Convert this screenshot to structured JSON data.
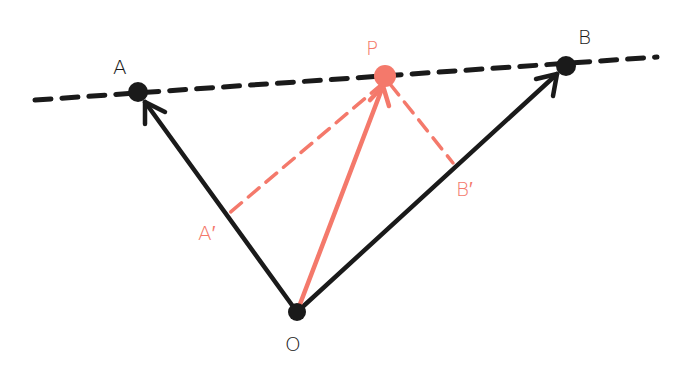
{
  "colors": {
    "black": "#1a1a1a",
    "salmon": "#f4796b",
    "background": "#ffffff"
  },
  "diagram": {
    "type": "vector-projection",
    "points": {
      "O": {
        "label": "O",
        "x": 297,
        "y": 312
      },
      "A": {
        "label": "A",
        "x": 138,
        "y": 92
      },
      "B": {
        "label": "B",
        "x": 566,
        "y": 66
      },
      "P": {
        "label": "P",
        "x": 385,
        "y": 76
      },
      "A_prime": {
        "label": "A′",
        "x": 227,
        "y": 215
      },
      "B_prime": {
        "label": "B′",
        "x": 453,
        "y": 163
      }
    },
    "edges": [
      {
        "from": "O",
        "to": "A",
        "style": "solid-arrow",
        "color": "black"
      },
      {
        "from": "O",
        "to": "B",
        "style": "solid-arrow",
        "color": "black"
      },
      {
        "from": "O",
        "to": "P",
        "style": "solid-arrow",
        "color": "salmon"
      },
      {
        "from": "P",
        "to": "A_prime",
        "style": "dashed",
        "color": "salmon"
      },
      {
        "from": "P",
        "to": "B_prime",
        "style": "dashed",
        "color": "salmon"
      },
      {
        "from": "line_start",
        "to": "line_end",
        "style": "dashed",
        "color": "black",
        "note": "line through A, P, B"
      }
    ]
  },
  "labels": {
    "A": "A",
    "B": "B",
    "P": "P",
    "O": "O",
    "A_prime": "A′",
    "B_prime": "B′"
  }
}
